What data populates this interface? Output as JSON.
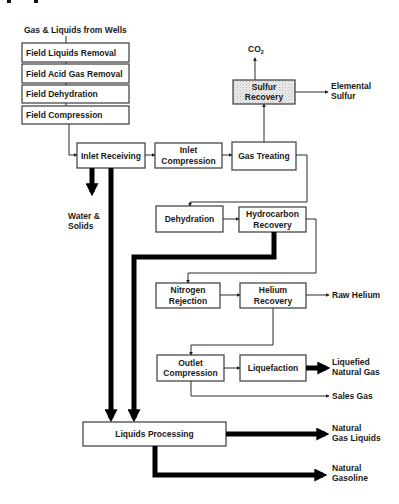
{
  "diagram": {
    "type": "process-flow"
  },
  "source": {
    "label": "Gas & Liquids from Wells"
  },
  "field_steps": [
    {
      "label": "Field Liquids Removal"
    },
    {
      "label": "Field Acid Gas Removal"
    },
    {
      "label": "Field Dehydration"
    },
    {
      "label": "Field Compression"
    }
  ],
  "nodes": {
    "inlet_receiving": {
      "line1": "Inlet Receiving"
    },
    "inlet_compression": {
      "line1": "Inlet",
      "line2": "Compression"
    },
    "gas_treating": {
      "line1": "Gas Treating"
    },
    "sulfur_recovery": {
      "line1": "Sulfur",
      "line2": "Recovery"
    },
    "dehydration": {
      "line1": "Dehydration"
    },
    "hydrocarbon_recovery": {
      "line1": "Hydrocarbon",
      "line2": "Recovery"
    },
    "nitrogen_rejection": {
      "line1": "Nitrogen",
      "line2": "Rejection"
    },
    "helium_recovery": {
      "line1": "Helium",
      "line2": "Recovery"
    },
    "outlet_compression": {
      "line1": "Outlet",
      "line2": "Compression"
    },
    "liquefaction": {
      "line1": "Liquefaction"
    },
    "liquids_processing": {
      "line1": "Liquids Processing"
    }
  },
  "outputs": {
    "co2": {
      "main": "CO",
      "sub": "2"
    },
    "elemental_sulfur": {
      "line1": "Elemental",
      "line2": "Sulfur"
    },
    "water_solids": {
      "line1": "Water &",
      "line2": "Solids"
    },
    "raw_helium": {
      "line1": "Raw Helium"
    },
    "lng": {
      "line1": "Liquefied",
      "line2": "Natural Gas"
    },
    "sales_gas": {
      "line1": "Sales Gas"
    },
    "ngl": {
      "line1": "Natural",
      "line2": "Gas Liquids"
    },
    "natural_gasoline": {
      "line1": "Natural",
      "line2": "Gasoline"
    }
  },
  "colors": {
    "box_stroke": "#3a3a3a",
    "text": "#1a1a1a",
    "thick_flow": "#000000",
    "sulfur_fill": "#e2e2e2"
  }
}
